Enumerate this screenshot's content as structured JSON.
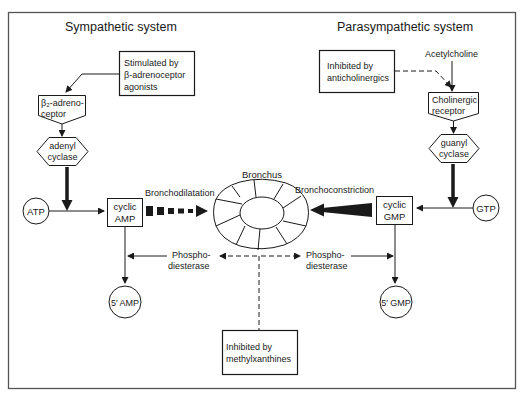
{
  "diagram": {
    "titles": {
      "left": "Sympathetic system",
      "right": "Parasympathetic system"
    },
    "sympathetic": {
      "stimulus_box": [
        "Stimulated by",
        "β-adrenoceptor",
        "agonists"
      ],
      "receptor": [
        "β₂-adreno-",
        "ceptor"
      ],
      "enzyme": [
        "adenyl",
        "cyclase"
      ],
      "substrate": "ATP",
      "second_messenger": [
        "cyclic",
        "AMP"
      ],
      "effect": "Bronchodilatation",
      "metabolite": "5′ AMP"
    },
    "parasympathetic": {
      "inhibitor_box": [
        "Inhibited by",
        "anticholinergics"
      ],
      "ligand": "Acetylcholine",
      "receptor": [
        "Cholinergic",
        "receptor"
      ],
      "enzyme": [
        "guanyl",
        "cyclase"
      ],
      "substrate": "GTP",
      "second_messenger": [
        "cyclic",
        "GMP"
      ],
      "effect": "Bronchoconstriction",
      "metabolite": "5′ GMP"
    },
    "center": {
      "organ": "Bronchus",
      "enzyme_left": [
        "Phospho-",
        "diesterase"
      ],
      "enzyme_right": [
        "Phospho-",
        "diesterase"
      ],
      "inhibitor_box": [
        "Inhibited by",
        "methylxanthines"
      ]
    },
    "colors": {
      "ink": "#1a1a1a",
      "frame": "#555555",
      "background": "#ffffff"
    }
  }
}
